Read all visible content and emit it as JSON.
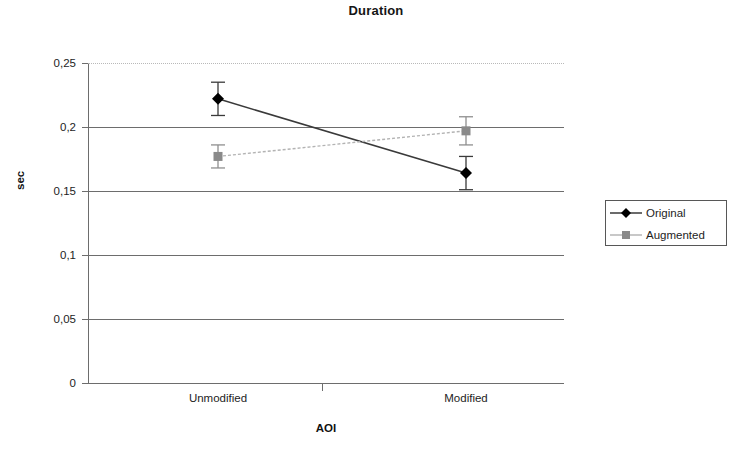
{
  "chart_data": {
    "type": "line",
    "title": "Duration",
    "xlabel": "AOI",
    "ylabel": "sec",
    "categories": [
      "Unmodified",
      "Modified"
    ],
    "ylim": [
      0,
      0.25
    ],
    "ytick_values": [
      0,
      0.05,
      0.1,
      0.15,
      0.2,
      0.25
    ],
    "ytick_labels": [
      "0",
      "0,05",
      "0,1",
      "0,15",
      "0,2",
      "0,25"
    ],
    "grid": true,
    "legend_position": "right",
    "decimal_separator": ",",
    "series": [
      {
        "name": "Original",
        "values": [
          0.222,
          0.164
        ],
        "errors": [
          0.013,
          0.013
        ],
        "marker": "diamond",
        "color": "#000000",
        "line_color": "#3a3a3a"
      },
      {
        "name": "Augmented",
        "values": [
          0.177,
          0.197
        ],
        "errors": [
          0.009,
          0.011
        ],
        "marker": "square",
        "color": "#8a8a8a",
        "line_color": "#b3b3b3"
      }
    ]
  },
  "legend": {
    "items": [
      {
        "label": "Original"
      },
      {
        "label": "Augmented"
      }
    ]
  },
  "axes": {
    "y_title": "sec",
    "x_title": "AOI",
    "y_labels": [
      "0,25",
      "0,2",
      "0,15",
      "0,1",
      "0,05",
      "0"
    ],
    "x_labels": [
      "Unmodified",
      "Modified"
    ]
  },
  "header": {
    "title": "Duration"
  }
}
